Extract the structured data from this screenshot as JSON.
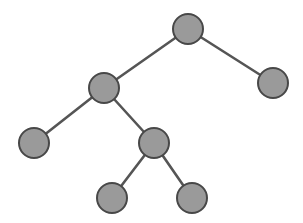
{
  "figure": {
    "name": "binary-tree-diagram",
    "type": "node-link-tree",
    "width": 303,
    "height": 223,
    "background_color": "#ffffff",
    "has_labels": false,
    "node_count": 7,
    "edge_count": 6,
    "depth": 4
  },
  "style": {
    "node_fill": "#9a9a9a",
    "node_stroke": "#484848",
    "node_stroke_width": 2,
    "node_radius": 15,
    "edge_color": "#555555",
    "edge_width": 2.6
  },
  "nodes": [
    {
      "id": "root",
      "label": "",
      "cx": 188,
      "cy": 29,
      "r": 15,
      "role": "root",
      "depth": 0
    },
    {
      "id": "n-l",
      "label": "",
      "cx": 104,
      "cy": 88,
      "r": 15,
      "role": "internal",
      "depth": 1
    },
    {
      "id": "n-r",
      "label": "",
      "cx": 273,
      "cy": 83,
      "r": 15,
      "role": "leaf",
      "depth": 1
    },
    {
      "id": "n-ll",
      "label": "",
      "cx": 34,
      "cy": 143,
      "r": 15,
      "role": "leaf",
      "depth": 2
    },
    {
      "id": "n-lr",
      "label": "",
      "cx": 154,
      "cy": 143,
      "r": 15,
      "role": "internal",
      "depth": 2
    },
    {
      "id": "n-lrl",
      "label": "",
      "cx": 112,
      "cy": 198,
      "r": 15,
      "role": "leaf",
      "depth": 3
    },
    {
      "id": "n-lrr",
      "label": "",
      "cx": 192,
      "cy": 198,
      "r": 15,
      "role": "leaf",
      "depth": 3
    }
  ],
  "edges": [
    {
      "id": "e-root-l",
      "from": "root",
      "to": "n-l",
      "x1": 188,
      "y1": 29,
      "x2": 104,
      "y2": 88
    },
    {
      "id": "e-root-r",
      "from": "root",
      "to": "n-r",
      "x1": 188,
      "y1": 29,
      "x2": 273,
      "y2": 83
    },
    {
      "id": "e-l-ll",
      "from": "n-l",
      "to": "n-ll",
      "x1": 104,
      "y1": 88,
      "x2": 34,
      "y2": 143
    },
    {
      "id": "e-l-lr",
      "from": "n-l",
      "to": "n-lr",
      "x1": 104,
      "y1": 88,
      "x2": 154,
      "y2": 143
    },
    {
      "id": "e-lr-lrl",
      "from": "n-lr",
      "to": "n-lrl",
      "x1": 154,
      "y1": 143,
      "x2": 112,
      "y2": 198
    },
    {
      "id": "e-lr-lrr",
      "from": "n-lr",
      "to": "n-lrr",
      "x1": 154,
      "y1": 143,
      "x2": 192,
      "y2": 198
    }
  ]
}
